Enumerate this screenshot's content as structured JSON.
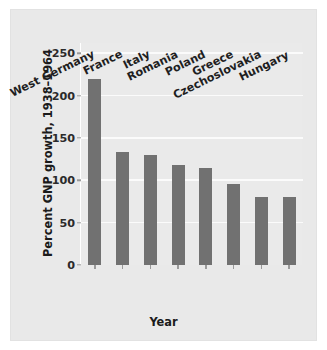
{
  "chart_data": {
    "type": "bar",
    "title": "",
    "xlabel": "Year",
    "ylabel": "Percent GNP growth, 1938–1964",
    "categories": [
      "West Germany",
      "France",
      "Italy",
      "Romania",
      "Poland",
      "Greece",
      "Czechoslovakia",
      "Hungary"
    ],
    "values": [
      220,
      133,
      130,
      118,
      115,
      96,
      80,
      80
    ],
    "ylim": [
      0,
      262
    ],
    "yticks": [
      0,
      50,
      100,
      150,
      200,
      250
    ],
    "ytick_labels": [
      "0",
      "50",
      "100",
      "150",
      "200",
      "250"
    ],
    "grid": true,
    "legend": null,
    "bar_color": "#717171",
    "panel_color": "#e9e9e9",
    "plot_color": "#eaeaea",
    "grid_color": "#fbfbfb"
  }
}
